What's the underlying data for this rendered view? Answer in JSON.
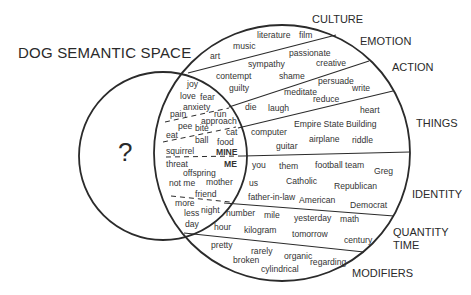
{
  "title": "DOG SEMANTIC SPACE",
  "unknown_symbol": "?",
  "colors": {
    "line": "#2b2b2b",
    "text": "#333333",
    "background": "#ffffff"
  },
  "circles": {
    "dog": {
      "cx": 163,
      "cy": 156,
      "r": 84
    },
    "human": {
      "cx": 282,
      "cy": 153,
      "r": 128
    }
  },
  "categories": [
    {
      "label": "CULTURE",
      "x": 312,
      "y": 23
    },
    {
      "label": "EMOTION",
      "x": 360,
      "y": 45
    },
    {
      "label": "ACTION",
      "x": 392,
      "y": 71
    },
    {
      "label": "THINGS",
      "x": 416,
      "y": 127
    },
    {
      "label": "IDENTITY",
      "x": 412,
      "y": 198
    },
    {
      "label": "QUANTITY",
      "x": 393,
      "y": 236
    },
    {
      "label": "TIME",
      "x": 393,
      "y": 249
    },
    {
      "label": "MODIFIERS",
      "x": 352,
      "y": 277
    }
  ],
  "words": [
    {
      "text": "literature",
      "x": 257,
      "y": 38
    },
    {
      "text": "film",
      "x": 299,
      "y": 38
    },
    {
      "text": "music",
      "x": 233,
      "y": 49
    },
    {
      "text": "art",
      "x": 210,
      "y": 59
    },
    {
      "text": "passionate",
      "x": 289,
      "y": 56
    },
    {
      "text": "sympathy",
      "x": 248,
      "y": 67
    },
    {
      "text": "creative",
      "x": 316,
      "y": 66
    },
    {
      "text": "contempt",
      "x": 216,
      "y": 79
    },
    {
      "text": "shame",
      "x": 279,
      "y": 79
    },
    {
      "text": "persuade",
      "x": 318,
      "y": 84
    },
    {
      "text": "guilty",
      "x": 229,
      "y": 91
    },
    {
      "text": "write",
      "x": 352,
      "y": 91
    },
    {
      "text": "meditate",
      "x": 284,
      "y": 95
    },
    {
      "text": "reduce",
      "x": 313,
      "y": 102
    },
    {
      "text": "die",
      "x": 245,
      "y": 110
    },
    {
      "text": "laugh",
      "x": 268,
      "y": 111
    },
    {
      "text": "heart",
      "x": 360,
      "y": 113
    },
    {
      "text": "Empire State Building",
      "x": 294,
      "y": 127
    },
    {
      "text": "computer",
      "x": 251,
      "y": 135
    },
    {
      "text": "airplane",
      "x": 309,
      "y": 142
    },
    {
      "text": "riddle",
      "x": 352,
      "y": 143
    },
    {
      "text": "guitar",
      "x": 276,
      "y": 149
    },
    {
      "text": "you",
      "x": 252,
      "y": 168
    },
    {
      "text": "them",
      "x": 279,
      "y": 169
    },
    {
      "text": "football team",
      "x": 315,
      "y": 168
    },
    {
      "text": "Greg",
      "x": 374,
      "y": 174
    },
    {
      "text": "us",
      "x": 249,
      "y": 186
    },
    {
      "text": "Catholic",
      "x": 286,
      "y": 184
    },
    {
      "text": "Republican",
      "x": 334,
      "y": 189
    },
    {
      "text": "father-in-law",
      "x": 248,
      "y": 200
    },
    {
      "text": "American",
      "x": 299,
      "y": 203
    },
    {
      "text": "Democrat",
      "x": 350,
      "y": 208
    },
    {
      "text": "number",
      "x": 226,
      "y": 216
    },
    {
      "text": "mile",
      "x": 264,
      "y": 218
    },
    {
      "text": "yesterday",
      "x": 294,
      "y": 221
    },
    {
      "text": "math",
      "x": 340,
      "y": 222
    },
    {
      "text": "hour",
      "x": 214,
      "y": 230
    },
    {
      "text": "kilogram",
      "x": 244,
      "y": 233
    },
    {
      "text": "tomorrow",
      "x": 292,
      "y": 237
    },
    {
      "text": "century",
      "x": 344,
      "y": 243
    },
    {
      "text": "pretty",
      "x": 211,
      "y": 248
    },
    {
      "text": "rarely",
      "x": 251,
      "y": 254
    },
    {
      "text": "organic",
      "x": 284,
      "y": 259
    },
    {
      "text": "broken",
      "x": 233,
      "y": 263
    },
    {
      "text": "regarding",
      "x": 310,
      "y": 265
    },
    {
      "text": "cylindrical",
      "x": 261,
      "y": 272
    }
  ],
  "lens_words": [
    {
      "text": "joy",
      "x": 187,
      "y": 87,
      "bold": false
    },
    {
      "text": "love",
      "x": 180,
      "y": 99,
      "bold": false
    },
    {
      "text": "fear",
      "x": 200,
      "y": 100,
      "bold": false
    },
    {
      "text": "anxiety",
      "x": 183,
      "y": 110,
      "bold": false
    },
    {
      "text": "pain",
      "x": 170,
      "y": 117,
      "bold": false
    },
    {
      "text": "run",
      "x": 214,
      "y": 117,
      "bold": false
    },
    {
      "text": "approach",
      "x": 201,
      "y": 124,
      "bold": false
    },
    {
      "text": "pee",
      "x": 178,
      "y": 129,
      "bold": false
    },
    {
      "text": "bite",
      "x": 195,
      "y": 131,
      "bold": false
    },
    {
      "text": "cat",
      "x": 226,
      "y": 135,
      "bold": false
    },
    {
      "text": "eat",
      "x": 166,
      "y": 138,
      "bold": false
    },
    {
      "text": "ball",
      "x": 195,
      "y": 143,
      "bold": false
    },
    {
      "text": "food",
      "x": 217,
      "y": 145,
      "bold": false
    },
    {
      "text": "squirrel",
      "x": 166,
      "y": 154,
      "bold": false
    },
    {
      "text": "MINE",
      "x": 216,
      "y": 155,
      "bold": true
    },
    {
      "text": "threat",
      "x": 166,
      "y": 167,
      "bold": false
    },
    {
      "text": "ME",
      "x": 224,
      "y": 167,
      "bold": true
    },
    {
      "text": "offspring",
      "x": 183,
      "y": 176,
      "bold": false
    },
    {
      "text": "not me",
      "x": 169,
      "y": 186,
      "bold": false
    },
    {
      "text": "mother",
      "x": 206,
      "y": 185,
      "bold": false
    },
    {
      "text": "friend",
      "x": 195,
      "y": 197,
      "bold": false
    },
    {
      "text": "more",
      "x": 175,
      "y": 206,
      "bold": false
    },
    {
      "text": "night",
      "x": 201,
      "y": 213,
      "bold": false
    },
    {
      "text": "less",
      "x": 184,
      "y": 216,
      "bold": false
    },
    {
      "text": "day",
      "x": 185,
      "y": 227,
      "bold": false
    }
  ]
}
